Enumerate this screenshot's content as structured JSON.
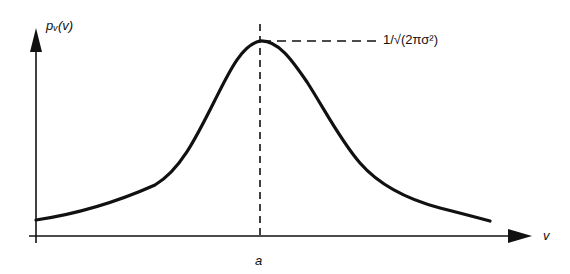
{
  "diagram": {
    "type": "probability-density-curve",
    "y_axis_label": "pᵥ(v)",
    "x_axis_label": "v",
    "mean_label": "a",
    "peak_label": "1/√(2πσ²)",
    "colors": {
      "ink": "#111111",
      "background": "#ffffff"
    }
  }
}
